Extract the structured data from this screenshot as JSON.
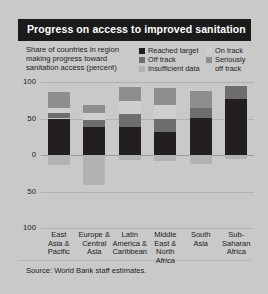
{
  "title": "Progress on access to improved sanitation",
  "subtitle": "Share of countries in region making progress toward sanitation access (percent)",
  "source": "Source: World Bank staff estimates.",
  "colors": {
    "background": "#c9c9c9",
    "title_bar": "#1b1b1b",
    "title_text": "#ffffff",
    "reached_target": "#231f20",
    "off_track": "#6e6e6e",
    "insufficient_data": "#b2b2b2",
    "on_track": "#cfcfcf",
    "seriously_off_track": "#8e8e8e",
    "gridline": "#b0b0b0"
  },
  "legend": {
    "items": [
      {
        "label": "Reached target",
        "color": "#231f20",
        "swatch": "legend-swatch-reached-target"
      },
      {
        "label": "Off track",
        "color": "#6e6e6e",
        "swatch": "legend-swatch-off-track"
      },
      {
        "label": "Insufficient data",
        "color": "#b2b2b2",
        "swatch": "legend-swatch-insufficient-data"
      },
      {
        "label": "On track",
        "color": "#cfcfcf",
        "swatch": "legend-swatch-on-track"
      },
      {
        "label": "Seriously\noff track",
        "color": "#8e8e8e",
        "swatch": "legend-swatch-seriously-off-track"
      }
    ]
  },
  "chart_data": {
    "type": "bar",
    "title": "Progress on access to improved sanitation",
    "subtitle": "Share of countries in region making progress toward sanitation access (percent)",
    "xlabel": "",
    "ylabel": "Share of countries in region making progress toward sanitation access (percent)",
    "ylim": [
      -100,
      100
    ],
    "yticks": [
      100,
      50,
      0,
      50,
      100
    ],
    "ytick_labels": [
      "100",
      "50",
      "0",
      "50",
      "100"
    ],
    "grid": true,
    "legend_position": "top-right",
    "stacked": true,
    "diverging": true,
    "note": "Positive segments stack upward from 0; 'Insufficient data' stacks downward from 0.",
    "categories": [
      "East Asia & Pacific",
      "Europe & Central Asia",
      "Latin America & Caribbean",
      "Middle East & North Africa",
      "South Asia",
      "Sub-Saharan Africa"
    ],
    "category_lines": [
      [
        "East",
        "Asia &",
        "Pacific"
      ],
      [
        "Europe &",
        "Central",
        "Asia"
      ],
      [
        "Latin",
        "America &",
        "Caribbean"
      ],
      [
        "Middle",
        "East &",
        "North",
        "Africa"
      ],
      [
        "South",
        "Asia"
      ],
      [
        "Sub-",
        "Saharan",
        "Africa"
      ]
    ],
    "series": [
      {
        "name": "Reached target",
        "color": "#231f20",
        "direction": "up",
        "values": [
          50,
          38,
          38,
          31,
          51,
          77
        ]
      },
      {
        "name": "Off track",
        "color": "#6e6e6e",
        "direction": "up",
        "values": [
          8,
          10,
          18,
          19,
          13,
          17
        ]
      },
      {
        "name": "On track",
        "color": "#cfcfcf",
        "direction": "up",
        "values": [
          7,
          9,
          18,
          19,
          0,
          0
        ]
      },
      {
        "name": "Seriously off track",
        "color": "#8e8e8e",
        "direction": "up",
        "values": [
          21,
          12,
          19,
          23,
          23,
          0
        ]
      },
      {
        "name": "Insufficient data",
        "color": "#b2b2b2",
        "direction": "down",
        "values": [
          14,
          41,
          7,
          8,
          13,
          6
        ]
      }
    ]
  }
}
